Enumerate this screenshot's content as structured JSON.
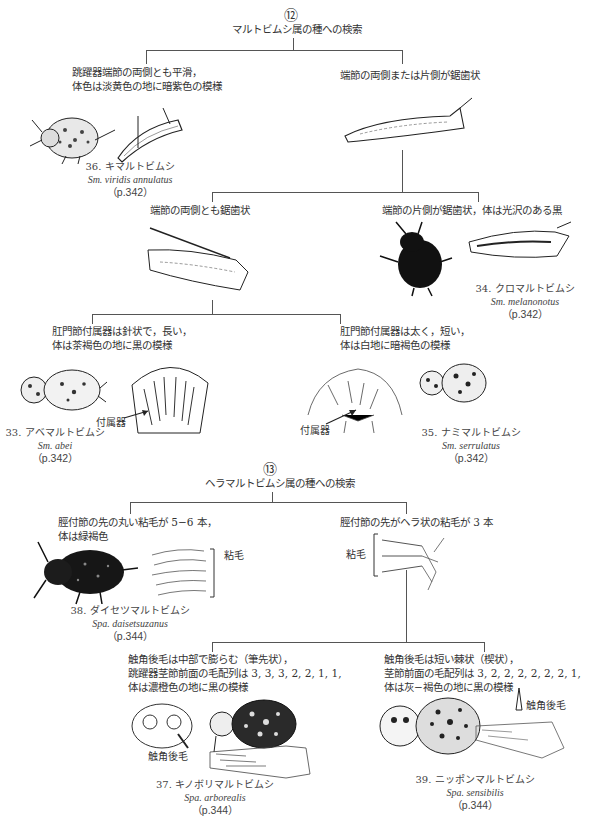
{
  "key12": {
    "number": "⑫",
    "title": "マルトビムシ属の種への検索",
    "left_branch": {
      "line1": "跳躍器端節の両側とも平滑，",
      "line2": "体色は淡黄色の地に暗紫色の模様"
    },
    "right_branch": {
      "text": "端節の両側または片側が鋸歯状"
    },
    "species36": {
      "ja": "36. キマルトビムシ",
      "latin": "Sm. viridis annulatus",
      "page": "（p.342）"
    },
    "sub_left": {
      "text": "端節の両側とも鋸歯状"
    },
    "sub_right": {
      "text": "端節の片側が鋸歯状，体は光沢のある黒"
    },
    "species34": {
      "ja": "34. クロマルトビムシ",
      "latin": "Sm. melanonotus",
      "page": "（p.342）"
    },
    "subsub_left": {
      "line1": "肛門節付属器は針状で，長い，",
      "line2": "体は茶褐色の地に黒の模様"
    },
    "subsub_right": {
      "line1": "肛門節付属器は太く，短い，",
      "line2": "体は白地に暗褐色の模様"
    },
    "appendage_label_left": "付属器",
    "appendage_label_right": "付属器",
    "species33": {
      "ja": "33. アベマルトビムシ",
      "latin": "Sm. abei",
      "page": "（p.342）"
    },
    "species35": {
      "ja": "35. ナミマルトビムシ",
      "latin": "Sm. serrulatus",
      "page": "（p.342）"
    }
  },
  "key13": {
    "number": "⑬",
    "title": "ヘラマルトビムシ属の種への検索",
    "left_branch": {
      "line1": "脛付節の先の丸い粘毛が 5−6 本，",
      "line2": "体は緑褐色"
    },
    "right_branch": {
      "text": "脛付節の先がヘラ状の粘毛が 3 本"
    },
    "tenent_label_left": "粘毛",
    "tenent_label_right": "粘毛",
    "species38": {
      "ja": "38. ダイセツマルトビムシ",
      "latin": "Spa. daisetsuzanus",
      "page": "（p.344）"
    },
    "sub_left": {
      "line1": "触角後毛は中部で膨らむ（筆先状），",
      "line2": "跳躍器茎節前面の毛配列は 3, 3, 3, 2, 2, 1, 1,",
      "line3": "体は濃橙色の地に黒の模様"
    },
    "sub_right": {
      "line1": "触角後毛は短い棘状（楔状），",
      "line2": "茎節前面の毛配列は 3, 2, 2, 2, 2, 2, 2, 1,",
      "line3": "体は灰−褐色の地に黒の模様"
    },
    "postantennal_label_left": "触角後毛",
    "postantennal_label_right": "触角後毛",
    "species37": {
      "ja": "37. キノボリマルトビムシ",
      "latin": "Spa. arborealis",
      "page": "（p.344）"
    },
    "species39": {
      "ja": "39. ニッポンマルトビムシ",
      "latin": "Spa. sensibilis",
      "page": "（p.344）"
    }
  }
}
